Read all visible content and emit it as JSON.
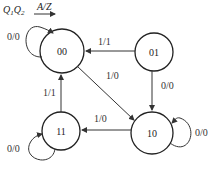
{
  "header": {
    "state_vars": "Q1Q2",
    "io_label": "A/Z"
  },
  "states": [
    {
      "id": "00",
      "label": "00"
    },
    {
      "id": "01",
      "label": "01"
    },
    {
      "id": "10",
      "label": "10"
    },
    {
      "id": "11",
      "label": "11"
    }
  ],
  "transitions": [
    {
      "from": "00",
      "to": "00",
      "label": "0/0"
    },
    {
      "from": "01",
      "to": "00",
      "label": "1/1"
    },
    {
      "from": "00",
      "to": "10",
      "label": "1/0"
    },
    {
      "from": "01",
      "to": "10",
      "label": "0/0"
    },
    {
      "from": "10",
      "to": "10",
      "label": "0/0"
    },
    {
      "from": "10",
      "to": "11",
      "label": "1/0"
    },
    {
      "from": "11",
      "to": "00",
      "label": "1/1"
    },
    {
      "from": "11",
      "to": "11",
      "label": "0/0"
    }
  ]
}
